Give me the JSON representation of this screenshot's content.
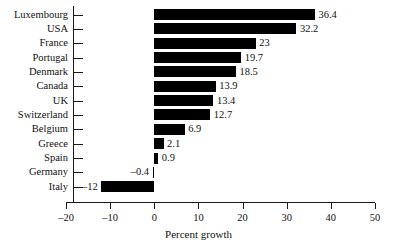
{
  "chart_data": {
    "type": "bar",
    "orientation": "horizontal",
    "title": "",
    "xlabel": "Percent growth",
    "ylabel": "",
    "xlim": [
      -20,
      50
    ],
    "xticks": [
      -20,
      -10,
      0,
      10,
      20,
      30,
      40,
      50
    ],
    "xticklabels": [
      "–20",
      "–10",
      "0",
      "10",
      "20",
      "30",
      "40",
      "50"
    ],
    "grid": false,
    "legend": false,
    "bar_color": "#000000",
    "categories": [
      "Luxembourg",
      "USA",
      "France",
      "Portugal",
      "Denmark",
      "Canada",
      "UK",
      "Switzerland",
      "Belgium",
      "Greece",
      "Spain",
      "Germany",
      "Italy"
    ],
    "values": [
      36.4,
      32.2,
      23,
      19.7,
      18.5,
      13.9,
      13.4,
      12.7,
      6.9,
      2.1,
      0.9,
      -0.4,
      -12
    ],
    "value_labels": [
      "36.4",
      "32.2",
      "23",
      "19.7",
      "18.5",
      "13.9",
      "13.4",
      "12.7",
      "6.9",
      "2.1",
      "0.9",
      "–0.4",
      "–12"
    ]
  }
}
